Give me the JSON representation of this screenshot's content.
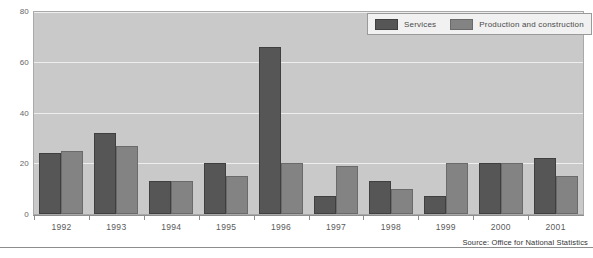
{
  "chart_data": {
    "type": "bar",
    "title": "",
    "xlabel": "",
    "ylabel": "",
    "categories": [
      "1992",
      "1993",
      "1994",
      "1995",
      "1996",
      "1997",
      "1998",
      "1999",
      "2000",
      "2001"
    ],
    "series": [
      {
        "name": "Services",
        "color": "#565656",
        "values": [
          24,
          32,
          13,
          20,
          66,
          7,
          13,
          7,
          20,
          22
        ]
      },
      {
        "name": "Production and construction",
        "color": "#838383",
        "values": [
          25,
          27,
          13,
          15,
          20,
          19,
          10,
          20,
          20,
          15
        ]
      }
    ],
    "ylim": [
      0,
      80
    ],
    "y_ticks": [
      0,
      20,
      40,
      60,
      80
    ],
    "y_tick_labels": [
      "0",
      "20",
      "40",
      "60",
      "80"
    ],
    "grid": true,
    "legend_position": "top-right",
    "plot_background": "#c9c9c9",
    "gridline_color": "#eeeeee"
  },
  "legend": {
    "entries": [
      {
        "label": "Services"
      },
      {
        "label": "Production and construction"
      }
    ]
  },
  "footer": {
    "source": "Source: Office for National Statistics"
  }
}
